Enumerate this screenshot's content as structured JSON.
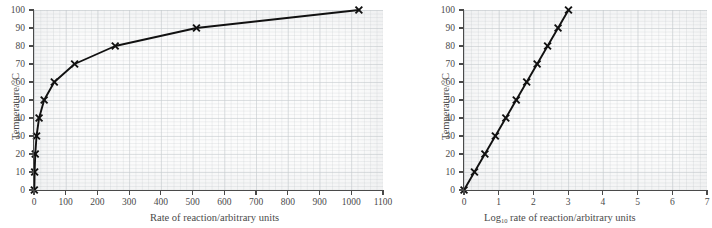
{
  "figure": {
    "background_color": "#ffffff",
    "grid_color": "#cdd2d5",
    "axis_color": "#4a4a4a",
    "series_color": "#111111",
    "marker": "cross-x"
  },
  "charts": [
    {
      "id": "left",
      "chart_data": {
        "type": "line",
        "title": "",
        "xlabel": "Rate of reaction/arbitrary units",
        "ylabel": "Temperature/°C",
        "xlim": [
          0,
          1100
        ],
        "ylim": [
          0,
          100
        ],
        "xticks": [
          0,
          100,
          200,
          300,
          400,
          500,
          600,
          700,
          800,
          900,
          1000,
          1100
        ],
        "yticks": [
          0,
          10,
          20,
          30,
          40,
          50,
          60,
          70,
          80,
          90,
          100
        ],
        "xticklabels": [
          "0",
          "100",
          "200",
          "300",
          "400",
          "500",
          "600",
          "700",
          "800",
          "900",
          "1000",
          "1100"
        ],
        "yticklabels": [
          "0",
          "10",
          "20",
          "30",
          "40",
          "50",
          "60",
          "70",
          "80",
          "90",
          "100"
        ],
        "grid": true,
        "legend": null,
        "marker": "x",
        "series": [
          {
            "name": "Rate vs temperature",
            "x": [
              1,
              2,
              4,
              8,
              16,
              32,
              64,
              128,
              256,
              512,
              1024
            ],
            "y": [
              0,
              10,
              20,
              30,
              40,
              50,
              60,
              70,
              80,
              90,
              100
            ]
          }
        ]
      }
    },
    {
      "id": "right",
      "chart_data": {
        "type": "line",
        "title": "",
        "xlabel": "Log10 rate of reaction/arbitrary units",
        "xlabel_base": "Log",
        "xlabel_sub": "10",
        "xlabel_rest": " rate of reaction/arbitrary units",
        "ylabel": "Temperature/°C",
        "xlim": [
          0,
          7
        ],
        "ylim": [
          0,
          100
        ],
        "xticks": [
          0,
          1,
          2,
          3,
          4,
          5,
          6,
          7
        ],
        "yticks": [
          0,
          10,
          20,
          30,
          40,
          50,
          60,
          70,
          80,
          90,
          100
        ],
        "xticklabels": [
          "0",
          "1",
          "2",
          "3",
          "4",
          "5",
          "6",
          "7"
        ],
        "yticklabels": [
          "0",
          "10",
          "20",
          "30",
          "40",
          "50",
          "60",
          "70",
          "80",
          "90",
          "100"
        ],
        "grid": true,
        "legend": null,
        "marker": "x",
        "series": [
          {
            "name": "Log10 rate vs temperature",
            "x": [
              0.0,
              0.301,
              0.602,
              0.903,
              1.204,
              1.505,
              1.806,
              2.107,
              2.408,
              2.709,
              3.01
            ],
            "y": [
              0,
              10,
              20,
              30,
              40,
              50,
              60,
              70,
              80,
              90,
              100
            ]
          }
        ]
      }
    }
  ]
}
